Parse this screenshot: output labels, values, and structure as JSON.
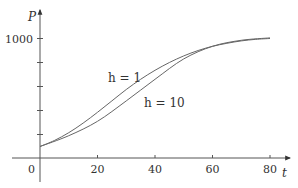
{
  "chart_data": {
    "type": "line",
    "title": "",
    "xlabel": "t",
    "ylabel": "P",
    "xlim": [
      0,
      85
    ],
    "ylim": [
      0,
      1100
    ],
    "x_ticks": [
      0,
      20,
      40,
      60,
      80
    ],
    "x_tick_labels": [
      "0",
      "20",
      "40",
      "60",
      "80"
    ],
    "y_ticks": [
      200,
      400,
      600,
      800,
      1000
    ],
    "y_tick_labels": [
      "",
      "",
      "",
      "",
      "1000"
    ],
    "grid": false,
    "legend": "inline annotations",
    "series": [
      {
        "name": "h = 1",
        "x": [
          0,
          5,
          10,
          15,
          20,
          25,
          30,
          35,
          40,
          45,
          50,
          55,
          60,
          65,
          70,
          75,
          80
        ],
        "values": [
          100,
          150,
          215,
          295,
          385,
          480,
          575,
          660,
          735,
          800,
          855,
          900,
          935,
          960,
          980,
          993,
          1000
        ]
      },
      {
        "name": "h = 10",
        "x": [
          0,
          10,
          20,
          30,
          40,
          50,
          60,
          70,
          80
        ],
        "values": [
          100,
          190,
          310,
          480,
          660,
          830,
          935,
          985,
          1005
        ]
      }
    ],
    "annotations": [
      {
        "text": "h = 1",
        "x": 28,
        "y": 740
      },
      {
        "text": "h = 10",
        "x": 38,
        "y": 590
      }
    ]
  },
  "labels": {
    "x_axis": "t",
    "y_axis": "P",
    "origin": "0",
    "x_ticks": [
      "20",
      "40",
      "60",
      "80"
    ],
    "y_top": "1000",
    "curve_h1": "h = 1",
    "curve_h10": "h = 10"
  }
}
